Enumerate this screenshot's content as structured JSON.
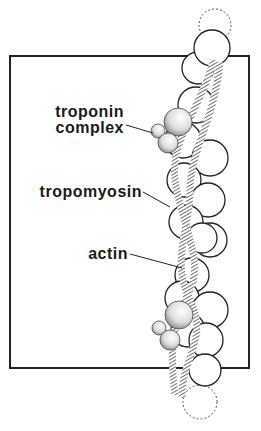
{
  "diagram": {
    "labels": {
      "troponin_line1": "troponin",
      "troponin_line2": "complex",
      "tropomyosin": "tropomyosin",
      "actin": "actin"
    }
  }
}
